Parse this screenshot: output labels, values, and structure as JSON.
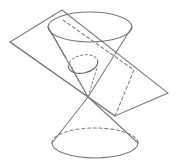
{
  "figure": {
    "title": "Double cone intersected by a plane (ellipse conic section)",
    "caption": "",
    "background_color": "#ffffff",
    "line_color": "#777777",
    "dash_color": "#7c7c7c",
    "width": 178,
    "height": 163
  },
  "geometry": {
    "apex": {
      "x": 88,
      "y": 97
    },
    "upper_cone": {
      "name": "upper-nappe",
      "base_ellipse": {
        "cx": 90,
        "cy": 27,
        "rx": 42,
        "ry": 15
      },
      "left_edge": {
        "x1": 48,
        "y1": 27,
        "x2": 88,
        "y2": 97
      },
      "right_edge": {
        "x1": 132,
        "y1": 27,
        "x2": 88,
        "y2": 97
      }
    },
    "lower_cone": {
      "name": "lower-nappe",
      "base_ellipse": {
        "cx": 95,
        "cy": 143,
        "rx": 43,
        "ry": 15
      },
      "left_edge": {
        "x1": 52,
        "y1": 143,
        "x2": 88,
        "y2": 97
      },
      "right_edge": {
        "x1": 138,
        "y1": 143,
        "x2": 88,
        "y2": 97
      }
    },
    "cutting_plane": {
      "name": "cutting-plane",
      "corners": [
        {
          "label": "top",
          "x": 62,
          "y": 10
        },
        {
          "label": "right",
          "x": 168,
          "y": 93
        },
        {
          "label": "bottom",
          "x": 115,
          "y": 116
        },
        {
          "label": "left",
          "x": 10,
          "y": 42
        }
      ]
    },
    "conic_section": {
      "name": "ellipse-intersection",
      "cx": 83,
      "cy": 64,
      "rx": 15,
      "ry": 9,
      "rotation": -12,
      "solid_arc_label": "front-visible-arc",
      "dashed_arc_label": "rear-hidden-arc"
    },
    "hidden_lines": [
      {
        "name": "top-ellipse-chord",
        "x1": 63,
        "y1": 20,
        "x2": 134,
        "y2": 70
      },
      {
        "name": "apex-to-section-left",
        "x1": 88,
        "y1": 97,
        "x2": 69,
        "y2": 62
      },
      {
        "name": "apex-to-section-right",
        "x1": 88,
        "y1": 97,
        "x2": 97,
        "y2": 68
      },
      {
        "name": "plane-hidden-edge-right",
        "x1": 115,
        "y1": 116,
        "x2": 134,
        "y2": 70
      }
    ]
  },
  "labels": {
    "items": []
  }
}
